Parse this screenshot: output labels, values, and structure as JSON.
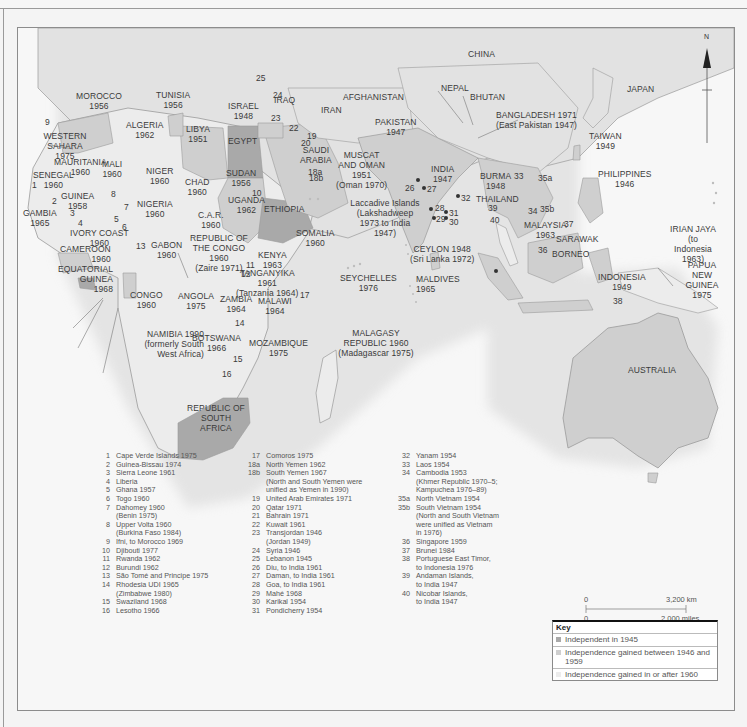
{
  "map": {
    "colors": {
      "independent_1945": "#a9a9a9",
      "independent_1946_1959": "#cfcfcf",
      "independent_1960_plus": "#ececec",
      "other_land": "#e2e2e2",
      "sea": "#f7f7f7",
      "border": "#9a9a9a"
    },
    "compass": {
      "label": "N"
    },
    "country_labels": [
      {
        "id": "morocco",
        "name": "MOROCCO",
        "year": "1956"
      },
      {
        "id": "algeria",
        "name": "ALGERIA",
        "year": "1962"
      },
      {
        "id": "tunisia",
        "name": "TUNISIA",
        "year": "1956"
      },
      {
        "id": "libya",
        "name": "LIBYA",
        "year": "1951"
      },
      {
        "id": "egypt",
        "name": "EGYPT",
        "year": ""
      },
      {
        "id": "israel",
        "name": "ISRAEL",
        "year": "1948"
      },
      {
        "id": "western-sahara",
        "name": "WESTERN SAHARA",
        "year": "1975"
      },
      {
        "id": "mauritania",
        "name": "MAURITANIA",
        "year": "1960"
      },
      {
        "id": "mali",
        "name": "MALI",
        "year": "1960"
      },
      {
        "id": "niger",
        "name": "NIGER",
        "year": "1960"
      },
      {
        "id": "chad",
        "name": "CHAD",
        "year": "1960"
      },
      {
        "id": "sudan",
        "name": "SUDAN",
        "year": "1956"
      },
      {
        "id": "senegal",
        "name": "SENEGAL",
        "year": "1960"
      },
      {
        "id": "gambia",
        "name": "GAMBIA",
        "year": "1965"
      },
      {
        "id": "guinea",
        "name": "GUINEA",
        "year": "1958"
      },
      {
        "id": "nigeria",
        "name": "NIGERIA",
        "year": "1960"
      },
      {
        "id": "ivory-coast",
        "name": "IVORY COAST",
        "year": "1960"
      },
      {
        "id": "car",
        "name": "C.A.R.",
        "year": "1960"
      },
      {
        "id": "uganda",
        "name": "UGANDA",
        "year": "1962"
      },
      {
        "id": "ethiopia",
        "name": "ETHIOPIA",
        "year": ""
      },
      {
        "id": "somalia",
        "name": "SOMALIA",
        "year": "1960"
      },
      {
        "id": "cameroon",
        "name": "CAMEROON",
        "year": "1960"
      },
      {
        "id": "equatorial-guinea",
        "name": "EQUATORIAL GUINEA",
        "year": "1968"
      },
      {
        "id": "gabon",
        "name": "GABON",
        "year": "1960"
      },
      {
        "id": "congo-republic",
        "name": "REPUBLIC OF THE CONGO",
        "year": "1960",
        "note": "(Zaire 1971)"
      },
      {
        "id": "kenya",
        "name": "KENYA",
        "year": "1963"
      },
      {
        "id": "tanganyika",
        "name": "TANGANYIKA",
        "year": "1961",
        "note": "(Tanzania 1964)"
      },
      {
        "id": "congo",
        "name": "CONGO",
        "year": "1960"
      },
      {
        "id": "angola",
        "name": "ANGOLA",
        "year": "1975"
      },
      {
        "id": "zambia",
        "name": "ZAMBIA",
        "year": "1964"
      },
      {
        "id": "malawi",
        "name": "MALAWI",
        "year": "1964"
      },
      {
        "id": "namibia",
        "name": "NAMIBIA 1990",
        "year": "",
        "note": "(formerly South West Africa)"
      },
      {
        "id": "botswana",
        "name": "BOTSWANA",
        "year": "1966"
      },
      {
        "id": "mozambique",
        "name": "MOZAMBIQUE",
        "year": "1975"
      },
      {
        "id": "south-africa",
        "name": "REPUBLIC OF SOUTH AFRICA",
        "year": ""
      },
      {
        "id": "malagasy",
        "name": "MALAGASY REPUBLIC 1960",
        "year": "",
        "note": "(Madagascar 1975)"
      },
      {
        "id": "seychelles",
        "name": "SEYCHELLES",
        "year": "1976"
      },
      {
        "id": "iraq",
        "name": "IRAQ",
        "year": ""
      },
      {
        "id": "iran",
        "name": "IRAN",
        "year": ""
      },
      {
        "id": "saudi-arabia",
        "name": "SAUDI ARABIA",
        "year": ""
      },
      {
        "id": "muscat-oman",
        "name": "MUSCAT AND OMAN",
        "year": "1951",
        "note": "(Oman 1970)"
      },
      {
        "id": "afghanistan",
        "name": "AFGHANISTAN",
        "year": ""
      },
      {
        "id": "pakistan",
        "name": "PAKISTAN",
        "year": "1947"
      },
      {
        "id": "india",
        "name": "INDIA",
        "year": "1947"
      },
      {
        "id": "nepal",
        "name": "NEPAL",
        "year": ""
      },
      {
        "id": "bhutan",
        "name": "BHUTAN",
        "year": ""
      },
      {
        "id": "china",
        "name": "CHINA",
        "year": ""
      },
      {
        "id": "bangladesh",
        "name": "BANGLADESH 1971",
        "year": "",
        "note": "(East Pakistan 1947)"
      },
      {
        "id": "laccadive",
        "name": "Laccadive Islands",
        "year": "",
        "note": "(Lakshadweep 1973 to India 1947)"
      },
      {
        "id": "ceylon",
        "name": "CEYLON 1948",
        "year": "",
        "note": "(Sri Lanka 1972)"
      },
      {
        "id": "maldives",
        "name": "MALDIVES",
        "year": "1965"
      },
      {
        "id": "burma",
        "name": "BURMA",
        "year": "1948"
      },
      {
        "id": "thailand",
        "name": "THAILAND",
        "year": ""
      },
      {
        "id": "japan",
        "name": "JAPAN",
        "year": ""
      },
      {
        "id": "taiwan",
        "name": "TAIWAN",
        "year": "1949"
      },
      {
        "id": "philippines",
        "name": "PHILIPPINES",
        "year": "1946"
      },
      {
        "id": "malaysia",
        "name": "MALAYSIA",
        "year": "1963"
      },
      {
        "id": "sarawak",
        "name": "SARAWAK",
        "year": ""
      },
      {
        "id": "borneo",
        "name": "BORNEO",
        "year": ""
      },
      {
        "id": "irian-jaya",
        "name": "IRIAN JAYA",
        "year": "",
        "note": "(to Indonesia 1963)"
      },
      {
        "id": "papua",
        "name": "PAPUA NEW GUINEA",
        "year": "1975"
      },
      {
        "id": "indonesia",
        "name": "INDONESIA",
        "year": "1949"
      },
      {
        "id": "australia",
        "name": "AUSTRALIA",
        "year": ""
      }
    ],
    "number_markers": [
      "1",
      "2",
      "3",
      "4",
      "5",
      "6",
      "7",
      "8",
      "9",
      "10",
      "11",
      "12",
      "13",
      "14",
      "15",
      "16",
      "17",
      "18a",
      "18b",
      "19",
      "20",
      "21",
      "22",
      "23",
      "24",
      "25",
      "26",
      "27",
      "28",
      "29",
      "30",
      "31",
      "32",
      "33",
      "34",
      "35a",
      "35b",
      "36",
      "37",
      "38",
      "39",
      "40"
    ]
  },
  "legend_list": {
    "column1": [
      {
        "n": "1",
        "t": "Cape Verde Islands 1975"
      },
      {
        "n": "2",
        "t": "Guinea-Bissau 1974"
      },
      {
        "n": "3",
        "t": "Sierra Leone 1961"
      },
      {
        "n": "4",
        "t": "Liberia"
      },
      {
        "n": "5",
        "t": "Ghana 1957"
      },
      {
        "n": "6",
        "t": "Togo 1960"
      },
      {
        "n": "7",
        "t": "Dahomey 1960"
      },
      {
        "n": "",
        "t": "(Benin 1975)"
      },
      {
        "n": "8",
        "t": "Upper Volta 1960"
      },
      {
        "n": "",
        "t": "(Burkina Faso 1984)"
      },
      {
        "n": "9",
        "t": "Ifni, to Morocco 1969"
      },
      {
        "n": "10",
        "t": "Djibouti 1977"
      },
      {
        "n": "11",
        "t": "Rwanda 1962"
      },
      {
        "n": "12",
        "t": "Burundi 1962"
      },
      {
        "n": "13",
        "t": "São Tomé and Principe 1975"
      },
      {
        "n": "14",
        "t": "Rhodesia UDI 1965"
      },
      {
        "n": "",
        "t": "(Zimbabwe 1980)"
      },
      {
        "n": "15",
        "t": "Swaziland 1968"
      },
      {
        "n": "16",
        "t": "Lesotho 1966"
      }
    ],
    "column2": [
      {
        "n": "17",
        "t": "Comoros 1975"
      },
      {
        "n": "18a",
        "t": "North Yemen 1962"
      },
      {
        "n": "18b",
        "t": "South Yemen 1967"
      },
      {
        "n": "",
        "t": "(North and South Yemen were"
      },
      {
        "n": "",
        "t": "unified as Yemen in 1990)"
      },
      {
        "n": "19",
        "t": "United Arab Emirates 1971"
      },
      {
        "n": "20",
        "t": "Qatar 1971"
      },
      {
        "n": "21",
        "t": "Bahrain 1971"
      },
      {
        "n": "22",
        "t": "Kuwait 1961"
      },
      {
        "n": "23",
        "t": "Transjordan 1946"
      },
      {
        "n": "",
        "t": "(Jordan 1949)"
      },
      {
        "n": "24",
        "t": "Syria 1946"
      },
      {
        "n": "25",
        "t": "Lebanon 1945"
      },
      {
        "n": "26",
        "t": "Diu, to India 1961"
      },
      {
        "n": "27",
        "t": "Daman, to India 1961"
      },
      {
        "n": "28",
        "t": "Goa, to India 1961"
      },
      {
        "n": "29",
        "t": "Mahé 1968"
      },
      {
        "n": "30",
        "t": "Karikal 1954"
      },
      {
        "n": "31",
        "t": "Pondicherry 1954"
      }
    ],
    "column3": [
      {
        "n": "32",
        "t": "Yanam 1954"
      },
      {
        "n": "33",
        "t": "Laos 1954"
      },
      {
        "n": "34",
        "t": "Cambodia 1953"
      },
      {
        "n": "",
        "t": "(Khmer Republic 1970–5;"
      },
      {
        "n": "",
        "t": "Kampuchea 1976–89)"
      },
      {
        "n": "35a",
        "t": "North Vietnam 1954"
      },
      {
        "n": "35b",
        "t": "South Vietnam 1954"
      },
      {
        "n": "",
        "t": "(North and South Vietnam"
      },
      {
        "n": "",
        "t": "were unified as Vietnam"
      },
      {
        "n": "",
        "t": "in 1976)"
      },
      {
        "n": "36",
        "t": "Singapore 1959"
      },
      {
        "n": "37",
        "t": "Brunei 1984"
      },
      {
        "n": "38",
        "t": "Portuguese East Timor,"
      },
      {
        "n": "",
        "t": "to Indonesia 1976"
      },
      {
        "n": "39",
        "t": "Andaman Islands,"
      },
      {
        "n": "",
        "t": "to India 1947"
      },
      {
        "n": "40",
        "t": "Nicobar Islands,"
      },
      {
        "n": "",
        "t": "to India 1947"
      }
    ]
  },
  "scale_bar": {
    "km_start": "0",
    "km_end": "3,200 km",
    "mi_start": "0",
    "mi_end": "2,000 miles"
  },
  "key": {
    "title": "Key",
    "items": [
      {
        "label": "Independent in 1945",
        "color": "#a9a9a9"
      },
      {
        "label": "Independence gained between 1946 and 1959",
        "color": "#cfcfcf"
      },
      {
        "label": "Independence gained in or after 1960",
        "color": "#ececec"
      }
    ]
  }
}
